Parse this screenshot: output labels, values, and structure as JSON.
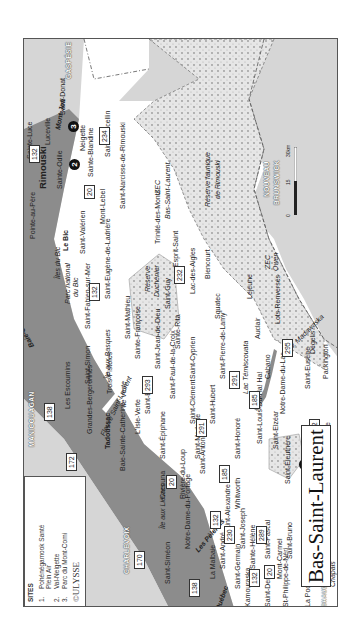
{
  "map": {
    "title": "Bas-Saint-Laurent",
    "publisher": "©ULYSSE",
    "colors": {
      "water": "#8c8c8c",
      "land_outside": "#d6d6d6",
      "land_region": "#ffffff",
      "reserve_pattern": "#c8c8c8",
      "frame": "#555555"
    },
    "legend": {
      "heading": "SITES",
      "items": [
        {
          "num": "1.",
          "label": "Pohénégamook Santé"
        },
        {
          "num": "",
          "label": "Plein Air"
        },
        {
          "num": "2.",
          "label": "Val-Neigette"
        },
        {
          "num": "3.",
          "label": "Parc du Mont-Comi"
        }
      ]
    },
    "scale": {
      "ticks": [
        "0",
        "15",
        "30km"
      ]
    },
    "regions": {
      "gaspesie": "GASPÉSIE",
      "nouveau_brunswick_1": "NOUVEAU",
      "nouveau_brunswick_2": "BRUNSWICK",
      "manicouagan": "MANICOUAGAN",
      "charlevoix": "CHARLEVOIX",
      "chaudiere": "CHAUDIÈRE-APPALACHES"
    },
    "water_labels": {
      "fleuve": "Fleuve Saint-Laurent",
      "iles_du_bic": "Îles du Bic",
      "ile_verte": "Île Verte",
      "ile_aux_basques": "Île aux Basques",
      "ile_aux_lievres": "Île aux Lièvres",
      "pelerins": "Les Pèlerins",
      "baie_comeau": "Baie-Comeau",
      "mont_joli": "Mont-Joli",
      "quebec_1": "Québec",
      "quebec_2": "Québec",
      "lac_temiscouata": "Lac Témiscouata",
      "riv_madawaska": "Riv. Madawaska"
    },
    "reserves": {
      "zec_bsl_1": "ZEC",
      "zec_bsl_2": "Bas-Saint-Laurent",
      "rf_rimouski_1": "Réserve faunique",
      "rf_rimouski_2": "de Rimouski",
      "duchenier_1": "Réserve",
      "duchenier_2": "Duchénier",
      "zec_owen_1": "ZEC",
      "zec_owen_2": "Owen",
      "zec_chapais_1": "ZEC",
      "zec_chapais_2": "Chapais",
      "parc_bic_1": "Parc national",
      "parc_bic_2": "du Bic"
    },
    "sites": [
      {
        "num": "1"
      },
      {
        "num": "2"
      },
      {
        "num": "3"
      }
    ],
    "routes": [
      "132",
      "20",
      "234",
      "232",
      "132",
      "293",
      "291",
      "291",
      "185",
      "185",
      "232",
      "295",
      "289",
      "289",
      "20",
      "132",
      "230",
      "20",
      "132",
      "138",
      "172",
      "138",
      "170"
    ],
    "towns": {
      "rimouski": "Rimouski",
      "sainte_luce": "Sainte-Luce",
      "pointe_au_pere": "Pointe-au-Père",
      "luceville": "Luceville",
      "saint_donat": "Saint-Donat",
      "sainte_odile": "Sainte-Odile",
      "neigette": "Neigette",
      "sainte_blandine": "Sainte-Blandine",
      "saint_marcellin": "Saint-Marcellin",
      "saint_valerien": "Saint-Valérien",
      "mont_lebel": "Mont-Lebel",
      "saint_narcisse": "Saint-Narcisse-de-Rimouski",
      "trinite": "Trinité-des-Monts",
      "esprit_saint": "Esprit-Saint",
      "le_bic": "Le Bic",
      "saint_fabien": "Saint-Fabien-sur-Mer",
      "saint_eugene": "Saint-Eugène-de-Ladrière",
      "saint_guy": "Saint-Guy",
      "lac_des_aigles": "Lac-des-Aigles",
      "biencourt": "Biencourt",
      "saint_simon": "Saint-Simon",
      "saint_mathieu": "Saint-Mathieu",
      "sainte_francoise": "Sainte-Françoise",
      "sainte_rita": "Sainte-Rita",
      "squatec": "Squatec",
      "lejeune": "Lejeune",
      "trois_pistoles": "Trois-Pistoles",
      "saint_jean_de_dieu": "Saint-Jean-de-Dieu",
      "saint_cyprien": "Saint-Cyprien",
      "saint_pierre_de_lamy": "Saint-Pierre-de-Lamy",
      "auclair": "Auclair",
      "lots_renverses": "Lots-Renversés",
      "saint_paul": "Saint-Paul-de-la-Croix",
      "saint_eloi": "Saint-Éloi",
      "saint_clement": "Saint-Clément",
      "saint_hubert": "Saint-Hubert",
      "cabano": "Cabano",
      "notre_dame_du_lac": "Notre-Dame-du-Lac",
      "saint_eusebe": "Saint-Eusèbe",
      "degelis": "Dégelis",
      "packington": "Packington",
      "l_isle_verte": "L'Isle-Verte",
      "saint_epiphane": "Saint-Épiphane",
      "saint_modeste": "Saint-Modeste",
      "saint_antonin": "Saint-Antonin",
      "saint_honore": "Saint-Honoré",
      "saint_louis": "Saint-Louis-Du-Ha! Ha!",
      "saint_elzear": "Saint-Elzéar",
      "whitworth": "Whitworth",
      "saint_eleuthere": "Saint-Éleuthère",
      "sully": "Sully",
      "estcourt": "Estcourt",
      "riviere_bleue": "Rivière-Bleue",
      "pohenegamook": "Pohénégamook",
      "cacouna": "Cacouna",
      "riviere_du_loup": "Rivière-du-Loup",
      "notre_dame_du_portage": "Notre-Dame-du-Portage",
      "saint_alexandre": "Saint-Alexandre",
      "saint_joseph": "Saint-Joseph",
      "saint_andre": "Saint-André",
      "sainte_helene": "Sainte-Hélène",
      "saint_pascal": "Saint-Pascal",
      "saint_germain": "Saint-Germain",
      "kamouraska": "Kamouraska",
      "mont_carmel": "Mont-Carmel",
      "saint_bruno": "Saint-Bruno",
      "saint_denis": "Saint-Denis",
      "st_philippe": "St-Philippe-de-Néri",
      "saint_pacome": "Saint-Pacôme",
      "saint_onesime": "Saint-Onésime",
      "la_pocatiere": "La Pocatière",
      "les_escoumins": "Les Escoumins",
      "grandes_bergeronnes": "Grandes-Bergeronnes",
      "tadoussac": "Tadoussac",
      "baie_sainte_catherine": "Baie-Sainte-Catherine",
      "saint_simeon": "Saint-Siméon",
      "la_malbaie": "La Malbaie"
    }
  }
}
